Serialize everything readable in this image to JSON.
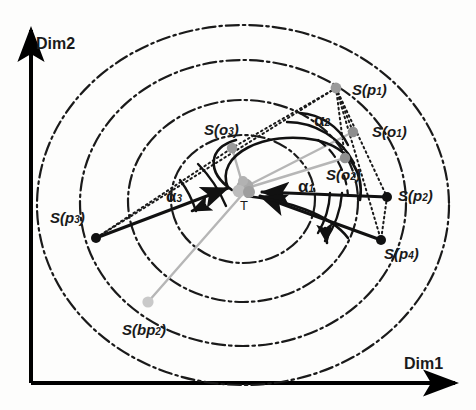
{
  "figure": {
    "background_color": "#fdfdfc",
    "axes": {
      "x_label": "Dim1",
      "y_label": "Dim2",
      "axis_color": "#000000"
    },
    "center_point": {
      "name": "T",
      "label": "T",
      "x": 245,
      "y": 190
    },
    "labels": {
      "p1": "S(p",
      "p1_sub": "1",
      "p1_close": ")",
      "o1": "S(o",
      "o1_sub": "1",
      "o1_close": ")",
      "o2": "S(o",
      "o2_sub": "2",
      "o2_close": ")",
      "o3": "S(o",
      "o3_sub": "3",
      "o3_close": ")",
      "p2": "S(p",
      "p2_sub": "2",
      "p2_close": ")",
      "p3": "S(p",
      "p3_sub": "3",
      "p3_close": ")",
      "p4": "S(p",
      "p4_sub": "4",
      "p4_close": ")",
      "bp2": "S(bp",
      "bp2_sub": "2",
      "bp2_close": ")",
      "alpha1": "α",
      "alpha1_sub": "1",
      "alpha2": "α",
      "alpha2_sub": "2",
      "alpha3": "α",
      "alpha3_sub": "3"
    },
    "points": [
      {
        "name": "S(p1)",
        "x": 336,
        "y": 88,
        "marker": "dot-gray",
        "color": "#9a9a9a"
      },
      {
        "name": "S(o1)",
        "x": 353,
        "y": 132,
        "marker": "dot-gray",
        "color": "#8f8f8f"
      },
      {
        "name": "S(o2)",
        "x": 345,
        "y": 158,
        "marker": "dot-gray",
        "color": "#8f8f8f"
      },
      {
        "name": "S(o3)",
        "x": 232,
        "y": 148,
        "marker": "dot-gray",
        "color": "#9a9a9a"
      },
      {
        "name": "S(p2)",
        "x": 387,
        "y": 197,
        "marker": "dot-black",
        "color": "#111111"
      },
      {
        "name": "S(p3)",
        "x": 96,
        "y": 238,
        "marker": "dot-black",
        "color": "#111111"
      },
      {
        "name": "S(p4)",
        "x": 381,
        "y": 240,
        "marker": "dot-black",
        "color": "#111111"
      },
      {
        "name": "S(bp2)",
        "x": 148,
        "y": 302,
        "marker": "dot-gray",
        "color": "#c4c4c4"
      },
      {
        "name": "T",
        "x": 245,
        "y": 190,
        "marker": "star-gray",
        "color": "#9b9b9b"
      }
    ],
    "contours": [
      {
        "name": "outer-contour",
        "cx": 243,
        "cy": 205,
        "rx": 206,
        "ry": 180,
        "style": "dash-dot"
      },
      {
        "name": "second-contour",
        "cx": 243,
        "cy": 203,
        "rx": 163,
        "ry": 143,
        "style": "dash-dot"
      },
      {
        "name": "third-contour",
        "cx": 243,
        "cy": 201,
        "rx": 115,
        "ry": 101,
        "style": "dash-dot"
      },
      {
        "name": "inner-contour",
        "cx": 243,
        "cy": 199,
        "rx": 72,
        "ry": 64,
        "style": "dash-dot"
      }
    ],
    "colors": {
      "black": "#111111",
      "gray": "#9a9a9a",
      "light_gray": "#cccccc",
      "dash_dot": "#1a1a1a"
    },
    "angles": [
      {
        "name": "alpha1",
        "label": "α1",
        "vertex": "T",
        "description": "angle at T between S(p2) ray and S(p4) ray"
      },
      {
        "name": "alpha2",
        "label": "α2",
        "vertex": "S(p1)",
        "description": "angle at S(p1) between rays to S(o1)/S(p2)"
      },
      {
        "name": "alpha3",
        "label": "α3",
        "vertex": "S(p3)",
        "description": "angle at S(p3) between rays to T and S(o3)"
      }
    ]
  }
}
